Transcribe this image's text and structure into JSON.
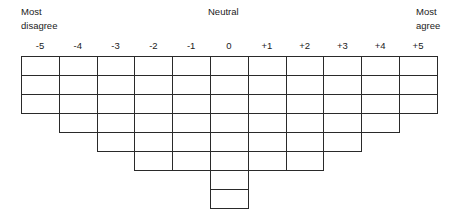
{
  "labels": {
    "left_top": "Most",
    "left_bottom": "disagree",
    "center": "Neutral",
    "right_top": "Most",
    "right_bottom": "agree"
  },
  "columns": [
    {
      "value": "-5",
      "cells": 3
    },
    {
      "value": "-4",
      "cells": 4
    },
    {
      "value": "-3",
      "cells": 5
    },
    {
      "value": "-2",
      "cells": 6
    },
    {
      "value": "-1",
      "cells": 6
    },
    {
      "value": "0",
      "cells": 8
    },
    {
      "value": "+1",
      "cells": 6
    },
    {
      "value": "+2",
      "cells": 6
    },
    {
      "value": "+3",
      "cells": 5
    },
    {
      "value": "+4",
      "cells": 4
    },
    {
      "value": "+5",
      "cells": 3
    }
  ],
  "style": {
    "line_color": "#2a2a2a",
    "background": "#ffffff"
  }
}
